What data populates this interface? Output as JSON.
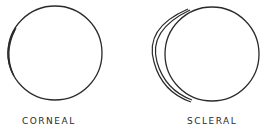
{
  "figure": {
    "panels": [
      {
        "id": "corneal",
        "label": "CORNEAL",
        "description": "Eye globe with small contact lens covering only the cornea"
      },
      {
        "id": "scleral",
        "label": "SCLERAL",
        "description": "Eye globe with large contact lens extending over the sclera"
      }
    ],
    "colors": {
      "stroke": "#2a2a2a",
      "background": "#ffffff"
    }
  }
}
